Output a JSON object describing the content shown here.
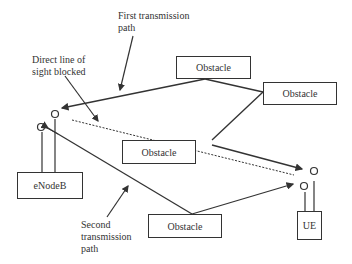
{
  "diagram": {
    "labels": {
      "first_path": [
        "First transmission",
        "path"
      ],
      "direct_blocked": [
        "Direct line of",
        "sight blocked"
      ],
      "second_path": [
        "Second",
        "transmission",
        "path"
      ]
    },
    "nodes": {
      "enodeb": "eNodeB",
      "ue": "UE",
      "obstacle_top": "Obstacle",
      "obstacle_right": "Obstacle",
      "obstacle_mid": "Obstacle",
      "obstacle_bottom": "Obstacle"
    },
    "colors": {
      "line": "#333333",
      "background": "#ffffff"
    }
  }
}
